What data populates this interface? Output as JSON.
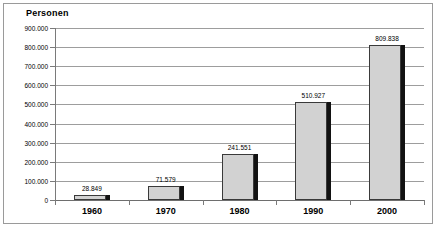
{
  "chart_data": {
    "type": "bar",
    "title": "",
    "ylabel": "Personen",
    "xlabel": "",
    "categories": [
      "1960",
      "1970",
      "1980",
      "1990",
      "2000"
    ],
    "values": [
      28849,
      71579,
      241551,
      510927,
      809838
    ],
    "value_labels": [
      "28.849",
      "71.579",
      "241.551",
      "510.927",
      "809.838"
    ],
    "ylim": [
      0,
      900000
    ],
    "ytick_values": [
      0,
      100000,
      200000,
      300000,
      400000,
      500000,
      600000,
      700000,
      800000,
      900000
    ],
    "ytick_labels": [
      "0",
      "100.000",
      "200.000",
      "300.000",
      "400.000",
      "500.000",
      "600.000",
      "700.000",
      "800.000",
      "900.000"
    ],
    "grid": true,
    "legend": false,
    "number_format": "de-DE",
    "series_name": "Personen",
    "colors": {
      "bar_fill": "#d2d2d2",
      "bar_outline": "#3a3a3a",
      "bar_shadow": "#121212",
      "gridline": "#9d9d9d",
      "axis": "#6e6e6e",
      "frame": "#9a9a9a",
      "text": "#000000",
      "background": "#ffffff"
    }
  }
}
